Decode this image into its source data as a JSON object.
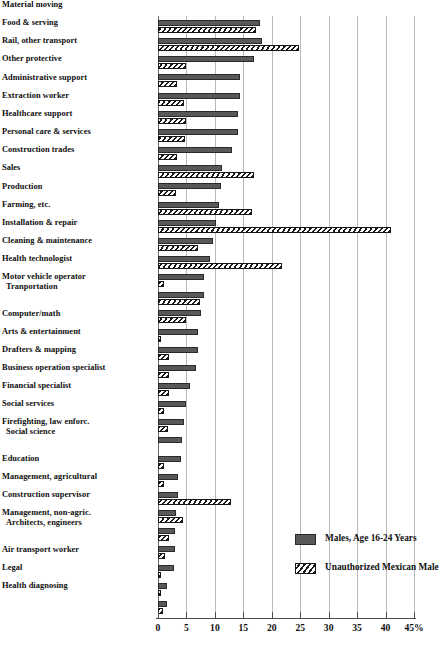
{
  "chart_data": {
    "type": "bar",
    "orientation": "horizontal",
    "title": "",
    "xlabel": "",
    "ylabel": "",
    "xlim": [
      0,
      45
    ],
    "xticks": [
      0,
      5,
      10,
      15,
      20,
      25,
      30,
      35,
      40,
      45
    ],
    "xtick_labels": [
      "0",
      "5",
      "10",
      "15",
      "20",
      "25",
      "30",
      "35",
      "40",
      "45%"
    ],
    "grid": true,
    "grid_axis": "x",
    "legend_position": "bottom-right",
    "categories": [
      "Material moving",
      "Food & serving",
      "Rail, other transport",
      "Other protective",
      "Administrative support",
      "Extraction worker",
      "Healthcare support",
      "Personal care & services",
      "Construction trades",
      "Sales",
      "Production",
      "Farming, etc.",
      "Installation & repair",
      "Cleaning & maintenance",
      "Health technologist",
      "Motor vehicle operator",
      "Tranportation",
      "Computer/math",
      "Arts & entertainment",
      "Drafters & mapping",
      "Business operation specialist",
      "Financial specialist",
      "Social services",
      "Firefighting, law enforc.",
      "Social science",
      "Education",
      "Management, agricultural",
      "Construction supervisor",
      "Management, non-agric.",
      "Architects, engineers",
      "Air transport worker",
      "Legal",
      "Health diagnosing"
    ],
    "series": [
      {
        "name": "Males, Age 16-24 Years",
        "pattern": "solid",
        "color": "#585858",
        "values": [
          18.0,
          18.2,
          16.8,
          14.4,
          14.4,
          14.0,
          14.0,
          13.0,
          11.2,
          11.0,
          10.8,
          10.2,
          9.6,
          9.2,
          8.0,
          8.0,
          7.6,
          7.0,
          7.0,
          6.6,
          5.6,
          5.0,
          4.6,
          4.2,
          4.0,
          3.6,
          3.6,
          3.2,
          3.0,
          3.0,
          2.8,
          1.6,
          1.6
        ]
      },
      {
        "name": "Unauthorized Mexican Male",
        "pattern": "hatched",
        "color": "#ffffff",
        "values": [
          17.2,
          24.8,
          5.0,
          3.4,
          4.6,
          5.0,
          4.8,
          3.4,
          16.8,
          3.2,
          16.6,
          41.0,
          7.0,
          21.8,
          1.0,
          7.4,
          5.0,
          0.5,
          2.0,
          2.0,
          2.0,
          1.0,
          1.8,
          0.0,
          1.0,
          1.0,
          12.8,
          4.4,
          2.0,
          1.2,
          0.4,
          0.6,
          0.8
        ]
      }
    ]
  },
  "legend": {
    "items": [
      {
        "label": "Males, Age 16-24 Years",
        "pattern": "solid"
      },
      {
        "label": "Unauthorized Mexican Male",
        "pattern": "hatched"
      }
    ]
  }
}
